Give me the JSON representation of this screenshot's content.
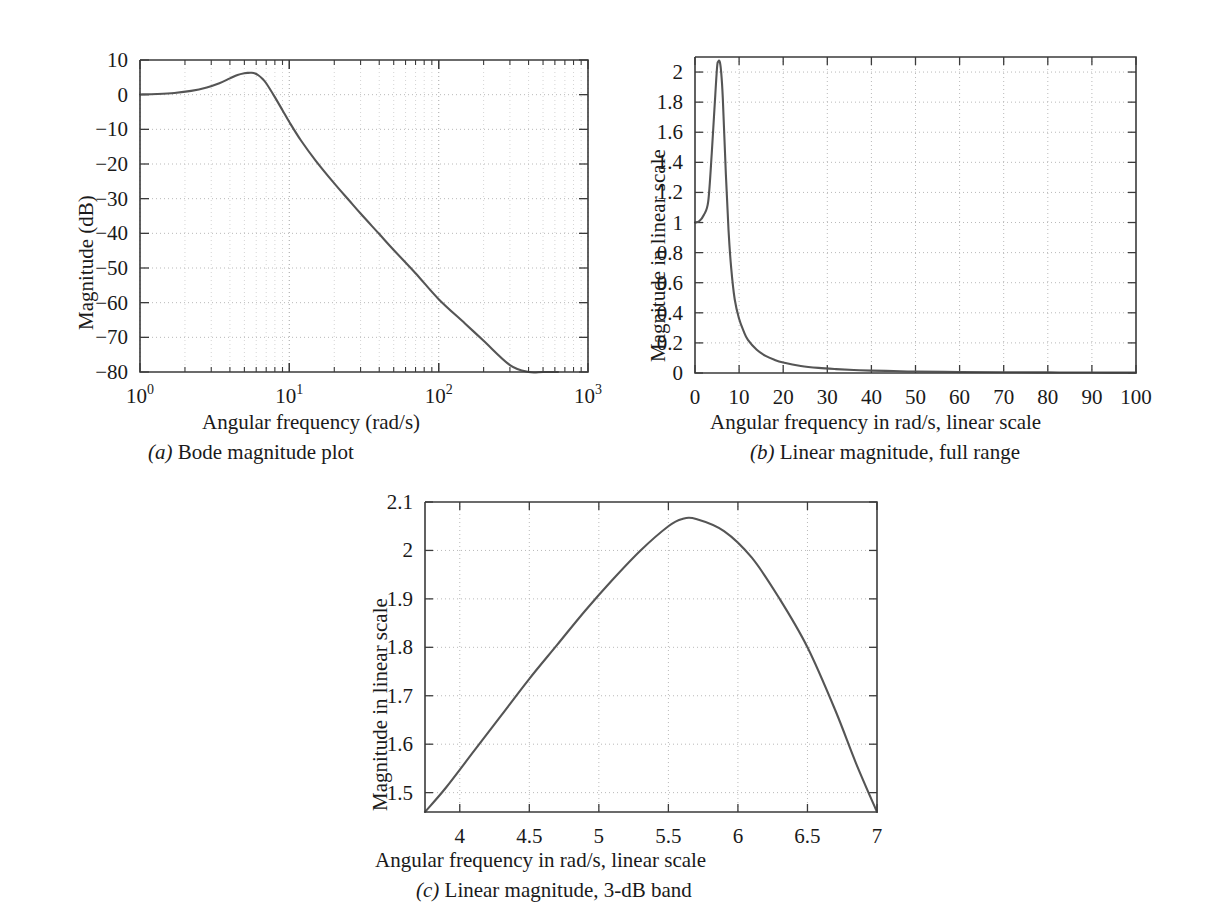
{
  "figure": {
    "background": "#ffffff",
    "curve_color": "#555555",
    "axis_color": "#3b3b3b",
    "grid_color": "#b9b9b9"
  },
  "panels": [
    {
      "id": "a",
      "caption_prefix": "(a)",
      "caption_text": " Bode magnitude plot",
      "xlabel": "Angular frequency (rad/s)",
      "ylabel": "Magnitude (dB)",
      "xticklabels": [
        "10",
        "10",
        "10",
        "10"
      ],
      "xtickexponents": [
        "0",
        "1",
        "2",
        "3"
      ],
      "yticklabels": [
        "10",
        "0",
        "−10",
        "−20",
        "−30",
        "−40",
        "−50",
        "−60",
        "−70",
        "−80"
      ]
    },
    {
      "id": "b",
      "caption_prefix": "(b)",
      "caption_text": " Linear magnitude, full range",
      "xlabel": "Angular frequency in rad/s, linear scale",
      "ylabel": "Magnitude in linear scale",
      "xticklabels": [
        "0",
        "10",
        "20",
        "30",
        "40",
        "50",
        "60",
        "70",
        "80",
        "90",
        "100"
      ],
      "yticklabels": [
        "0",
        "0.2",
        "0.4",
        "0.6",
        "0.8",
        "1",
        "1.2",
        "1.4",
        "1.6",
        "1.8",
        "2"
      ]
    },
    {
      "id": "c",
      "caption_prefix": "(c)",
      "caption_text": " Linear magnitude, 3-dB band",
      "xlabel": "Angular frequency in rad/s, linear scale",
      "ylabel": "Magnitude in linear scale",
      "xticklabels": [
        "4",
        "4.5",
        "5",
        "5.5",
        "6",
        "6.5",
        "7"
      ],
      "yticklabels": [
        "1.5",
        "1.6",
        "1.7",
        "1.8",
        "1.9",
        "2",
        "2.1"
      ]
    }
  ],
  "chart_data": [
    {
      "type": "line",
      "panel": "a",
      "title": "(a) Bode magnitude plot",
      "xlabel": "Angular frequency (rad/s)",
      "ylabel": "Magnitude (dB)",
      "xscale": "log",
      "yscale": "linear",
      "xlim": [
        1,
        1000
      ],
      "ylim": [
        -80,
        10
      ],
      "xticks": [
        1,
        10,
        100,
        1000
      ],
      "xticklabels": [
        "10^0",
        "10^1",
        "10^2",
        "10^3"
      ],
      "yticks": [
        10,
        0,
        -10,
        -20,
        -30,
        -40,
        -50,
        -60,
        -70,
        -80
      ],
      "grid": true,
      "legend": null,
      "series": [
        {
          "name": "magnitude (dB)",
          "x": [
            1,
            1.3,
            1.7,
            2.2,
            2.8,
            3.4,
            4.0,
            4.5,
            5.0,
            5.3,
            5.6,
            5.9,
            6.2,
            6.6,
            7.0,
            8.0,
            9.0,
            10,
            12,
            15,
            20,
            25,
            30,
            40,
            50,
            70,
            100,
            150,
            200,
            300,
            400,
            500,
            630
          ],
          "y": [
            0.05,
            0.2,
            0.5,
            1.1,
            2.1,
            3.3,
            4.7,
            5.7,
            6.2,
            6.3,
            6.3,
            6.1,
            5.6,
            4.6,
            3.3,
            -0.7,
            -4.5,
            -7.9,
            -13.3,
            -19.0,
            -25.6,
            -30.4,
            -34.3,
            -40.2,
            -44.8,
            -51.5,
            -59.0,
            -66.0,
            -71.0,
            -78.0,
            -83.0,
            -86.9,
            -91.0
          ]
        }
      ]
    },
    {
      "type": "line",
      "panel": "b",
      "title": "(b) Linear magnitude, full range",
      "xlabel": "Angular frequency in rad/s, linear scale",
      "ylabel": "Magnitude in linear scale",
      "xscale": "linear",
      "yscale": "linear",
      "xlim": [
        0,
        100
      ],
      "ylim": [
        0,
        2.1
      ],
      "xticks": [
        0,
        10,
        20,
        30,
        40,
        50,
        60,
        70,
        80,
        90,
        100
      ],
      "yticks": [
        0,
        0.2,
        0.4,
        0.6,
        0.8,
        1,
        1.2,
        1.4,
        1.6,
        1.8,
        2
      ],
      "grid": true,
      "legend": null,
      "series": [
        {
          "name": "magnitude (linear)",
          "x": [
            0,
            1,
            2,
            3,
            3.8,
            4.4,
            5.0,
            5.3,
            5.6,
            5.9,
            6.3,
            7.0,
            7.6,
            8.2,
            9,
            10,
            11,
            12,
            14,
            16,
            18,
            20,
            24,
            28,
            32,
            36,
            40,
            45,
            50,
            60,
            70,
            80,
            90,
            100
          ],
          "y": [
            1.0,
            1.01,
            1.05,
            1.14,
            1.46,
            1.75,
            2.03,
            2.07,
            2.07,
            2.01,
            1.83,
            1.32,
            0.95,
            0.7,
            0.49,
            0.36,
            0.28,
            0.22,
            0.155,
            0.114,
            0.088,
            0.07,
            0.047,
            0.034,
            0.026,
            0.02,
            0.016,
            0.013,
            0.01,
            0.007,
            0.005,
            0.004,
            0.003,
            0.0025
          ]
        }
      ]
    },
    {
      "type": "line",
      "panel": "c",
      "title": "(c) Linear magnitude, 3-dB band",
      "xlabel": "Angular frequency in rad/s, linear scale",
      "ylabel": "Magnitude in linear scale",
      "xscale": "linear",
      "yscale": "linear",
      "xlim": [
        3.75,
        7.0
      ],
      "ylim": [
        1.46,
        2.1
      ],
      "xticks": [
        4,
        4.5,
        5,
        5.5,
        6,
        6.5,
        7
      ],
      "yticks": [
        1.5,
        1.6,
        1.7,
        1.8,
        1.9,
        2,
        2.1
      ],
      "grid": true,
      "legend": null,
      "series": [
        {
          "name": "magnitude (linear)",
          "x": [
            3.75,
            3.9,
            4.1,
            4.3,
            4.5,
            4.7,
            4.9,
            5.1,
            5.3,
            5.5,
            5.6,
            5.7,
            5.9,
            6.1,
            6.3,
            6.5,
            6.7,
            6.85,
            7.0
          ],
          "y": [
            1.46,
            1.51,
            1.585,
            1.66,
            1.735,
            1.805,
            1.875,
            1.94,
            2.0,
            2.05,
            2.065,
            2.065,
            2.04,
            1.985,
            1.9,
            1.8,
            1.67,
            1.56,
            1.46
          ]
        }
      ]
    }
  ]
}
